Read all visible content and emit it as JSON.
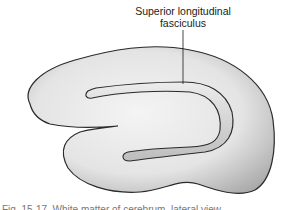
{
  "figure": {
    "label_line1": "Superior longitudinal",
    "label_line2": "fasciculus",
    "caption_visible_fragment": "Fig. 15-17. White matter of cerebrum, lateral view."
  },
  "colors": {
    "outline": "#2a2a2a",
    "fill_light": "#f0f0f0",
    "fill_mid": "#d6d6d6",
    "fill_dark": "#b5b5b5",
    "background": "#ffffff"
  }
}
